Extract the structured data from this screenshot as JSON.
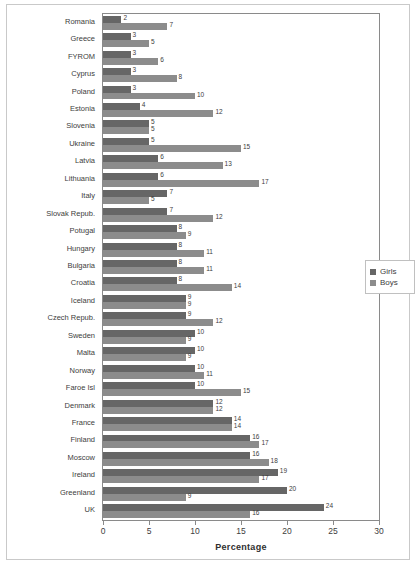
{
  "chart_data": {
    "type": "bar",
    "orientation": "horizontal",
    "title": "",
    "xlabel": "Percentage",
    "ylabel": "",
    "xlim": [
      0,
      30
    ],
    "xticks": [
      0,
      5,
      10,
      15,
      20,
      25,
      30
    ],
    "grid": false,
    "legend_position": "right",
    "categories": [
      "Romania",
      "Greece",
      "FYROM",
      "Cyprus",
      "Poland",
      "Estonia",
      "Slovenia",
      "Ukraine",
      "Latvia",
      "Lithuania",
      "Italy",
      "Slovak Repub.",
      "Potugal",
      "Hungary",
      "Bulgaria",
      "Croatia",
      "Iceland",
      "Czech Repub.",
      "Sweden",
      "Malta",
      "Norway",
      "Faroe Isl",
      "Denmark",
      "France",
      "Finland",
      "Moscow",
      "Ireland",
      "Greenland",
      "UK"
    ],
    "series": [
      {
        "name": "Girls",
        "color": "#666666",
        "values": [
          2,
          3,
          3,
          3,
          3,
          4,
          5,
          5,
          6,
          6,
          7,
          7,
          8,
          8,
          8,
          8,
          9,
          9,
          10,
          10,
          10,
          10,
          12,
          14,
          16,
          16,
          19,
          20,
          24
        ]
      },
      {
        "name": "Boys",
        "color": "#8c8c8c",
        "values": [
          7,
          5,
          6,
          8,
          10,
          12,
          5,
          15,
          13,
          17,
          5,
          12,
          9,
          11,
          11,
          14,
          9,
          12,
          9,
          9,
          11,
          15,
          12,
          14,
          17,
          18,
          17,
          9,
          16
        ]
      }
    ]
  },
  "legend": {
    "items": [
      {
        "label": "Girls",
        "color": "#666666"
      },
      {
        "label": "Boys",
        "color": "#8c8c8c"
      }
    ]
  },
  "axis": {
    "x_title": "Percentage",
    "tick_labels": [
      "0",
      "5",
      "10",
      "15",
      "20",
      "25",
      "30"
    ]
  },
  "caption": ""
}
